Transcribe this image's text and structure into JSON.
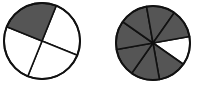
{
  "figure": {
    "colors": {
      "shaded": "#555555",
      "unshaded": "#ffffff",
      "stroke": "#111111"
    }
  },
  "circles": [
    {
      "id": "circle-left",
      "cx": 42,
      "cy": 41,
      "r": 38,
      "sectors_total": 4,
      "sectors_shaded": 1,
      "fraction_shaded": "1/4",
      "boundary_angles_deg": [
        -68,
        22,
        112,
        202
      ],
      "shaded_sector_indices": [
        3
      ]
    },
    {
      "id": "circle-right",
      "cx": 153,
      "cy": 43,
      "r": 37,
      "sectors_total": 8,
      "sectors_shaded": 7,
      "fraction_shaded": "7/8",
      "boundary_angles_deg": [
        -10,
        35,
        80,
        125,
        170,
        215,
        260,
        305
      ],
      "shaded_sector_indices": [
        1,
        2,
        3,
        4,
        5,
        6,
        7
      ]
    }
  ]
}
